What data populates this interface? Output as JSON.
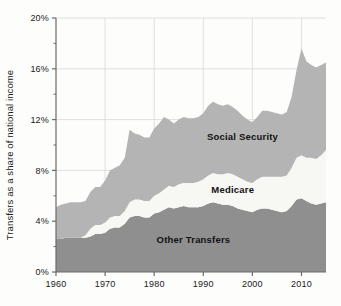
{
  "chart_data": {
    "type": "area",
    "stacked": true,
    "title": "",
    "subtitle": "",
    "xlabel": "",
    "ylabel": "Transfers as a share of national income",
    "xlim": [
      1960,
      2015
    ],
    "ylim": [
      0,
      20
    ],
    "y_tick_labels": [
      "0%",
      "4%",
      "8%",
      "12%",
      "16%",
      "20%"
    ],
    "y_ticks": [
      0,
      4,
      8,
      12,
      16,
      20
    ],
    "y_minor_ticks": [
      2,
      6,
      10,
      14,
      18
    ],
    "x_tick_labels": [
      "1960",
      "1970",
      "1980",
      "1990",
      "2000",
      "2010"
    ],
    "x_ticks": [
      1960,
      1970,
      1980,
      1990,
      2000,
      2010
    ],
    "grid": true,
    "grid_color": "#d8d8d8",
    "axis_color": "#6b6b6b",
    "background_color": "#fdfdfc",
    "legend_position": "inline-annotations",
    "units": "percent of national income",
    "x": [
      1960,
      1961,
      1962,
      1963,
      1964,
      1965,
      1966,
      1967,
      1968,
      1969,
      1970,
      1971,
      1972,
      1973,
      1974,
      1975,
      1976,
      1977,
      1978,
      1979,
      1980,
      1981,
      1982,
      1983,
      1984,
      1985,
      1986,
      1987,
      1988,
      1989,
      1990,
      1991,
      1992,
      1993,
      1994,
      1995,
      1996,
      1997,
      1998,
      1999,
      2000,
      2001,
      2002,
      2003,
      2004,
      2005,
      2006,
      2007,
      2008,
      2009,
      2010,
      2011,
      2012,
      2013,
      2014,
      2015
    ],
    "series": [
      {
        "name": "Other Transfers",
        "color": "#8f8f8f",
        "label_x": 1988,
        "label_y": 2.3,
        "values": [
          2.6,
          2.6,
          2.7,
          2.7,
          2.7,
          2.7,
          2.7,
          2.8,
          3.0,
          3.0,
          3.1,
          3.4,
          3.5,
          3.5,
          3.8,
          4.3,
          4.4,
          4.4,
          4.3,
          4.3,
          4.6,
          4.7,
          4.9,
          5.1,
          5.0,
          5.1,
          5.2,
          5.1,
          5.1,
          5.1,
          5.2,
          5.4,
          5.5,
          5.4,
          5.3,
          5.3,
          5.2,
          5.0,
          4.9,
          4.8,
          4.7,
          4.9,
          5.0,
          5.0,
          4.9,
          4.8,
          4.7,
          4.8,
          5.2,
          5.7,
          5.8,
          5.6,
          5.4,
          5.3,
          5.4,
          5.5
        ]
      },
      {
        "name": "Medicare",
        "color": "#f7f7f4",
        "label_x": 1996,
        "label_y": 6.2,
        "values": [
          0.0,
          0.0,
          0.0,
          0.0,
          0.0,
          0.0,
          0.2,
          0.6,
          0.7,
          0.7,
          0.8,
          0.9,
          0.9,
          0.9,
          1.0,
          1.2,
          1.3,
          1.3,
          1.3,
          1.3,
          1.4,
          1.5,
          1.6,
          1.7,
          1.7,
          1.8,
          1.8,
          1.9,
          1.9,
          2.0,
          2.1,
          2.2,
          2.3,
          2.3,
          2.4,
          2.5,
          2.5,
          2.5,
          2.4,
          2.3,
          2.3,
          2.4,
          2.5,
          2.5,
          2.6,
          2.7,
          2.8,
          2.8,
          3.0,
          3.3,
          3.4,
          3.4,
          3.6,
          3.6,
          3.8,
          4.1
        ]
      },
      {
        "name": "Social Security",
        "color": "#b4b4b4",
        "label_x": 1998,
        "label_y": 10.4,
        "values": [
          2.5,
          2.7,
          2.7,
          2.8,
          2.8,
          2.8,
          2.7,
          2.9,
          3.0,
          3.0,
          3.3,
          3.7,
          3.8,
          4.0,
          4.2,
          5.7,
          5.2,
          5.1,
          5.0,
          5.0,
          5.3,
          5.5,
          5.7,
          5.2,
          5.0,
          5.1,
          5.2,
          5.1,
          5.1,
          5.1,
          5.2,
          5.5,
          5.6,
          5.5,
          5.4,
          5.4,
          5.3,
          5.2,
          5.0,
          4.9,
          4.8,
          4.9,
          5.2,
          5.2,
          5.1,
          5.0,
          4.9,
          5.0,
          5.6,
          6.9,
          8.4,
          7.6,
          7.3,
          7.2,
          7.1,
          6.9
        ]
      }
    ]
  },
  "axes": {
    "y_title": "Transfers as a share of national income"
  }
}
